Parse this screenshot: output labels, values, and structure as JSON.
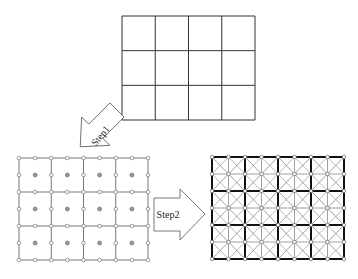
{
  "diagram": {
    "steps": [
      {
        "label": "Step1",
        "description": "Add nodes at edge midpoints and element centers"
      },
      {
        "label": "Step2",
        "description": "Subdivide each element into triangles"
      }
    ],
    "coarse_mesh": {
      "cols": 4,
      "rows": 3,
      "x": 122,
      "y": 16,
      "w": 133,
      "h": 104,
      "stroke": "#333333"
    },
    "node_mesh": {
      "cols": 4,
      "rows": 3,
      "x": 19,
      "y": 158,
      "w": 129,
      "h": 102,
      "stroke": "#777777",
      "node_fill": "#ffffff",
      "center_fill": "#999999"
    },
    "refined_mesh": {
      "cols": 4,
      "rows": 3,
      "x": 212,
      "y": 157,
      "w": 132,
      "h": 102,
      "edge_stroke": "#111111",
      "inner_stroke": "#888888"
    },
    "arrow_step1": {
      "label": "Step1"
    },
    "arrow_step2": {
      "label": "Step2"
    }
  }
}
